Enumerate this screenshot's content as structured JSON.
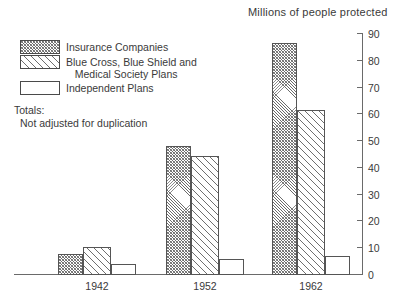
{
  "chart_data": {
    "type": "bar",
    "title": "Millions of people protected",
    "xlabel": "",
    "ylabel": "Millions of people protected",
    "categories": [
      "1942",
      "1952",
      "1962"
    ],
    "series": [
      {
        "name": "Insurance Companies",
        "values": [
          8,
          48,
          86.5
        ],
        "pattern": "dense-crosshatch"
      },
      {
        "name": "Blue Cross, Blue Shield and Medical Society Plans",
        "values": [
          10.5,
          44.5,
          61.5
        ],
        "pattern": "diagonal-hatch"
      },
      {
        "name": "Independent Plans",
        "values": [
          4,
          6,
          7
        ],
        "pattern": "empty"
      }
    ],
    "ylim": [
      0,
      90
    ],
    "yticks": [
      0,
      10,
      20,
      30,
      40,
      50,
      60,
      70,
      80,
      90
    ],
    "ytick_labels": [
      "0",
      "10",
      "20",
      "30",
      "40",
      "50",
      "60",
      "70",
      "80",
      "90"
    ],
    "grid": false,
    "legend_position": "upper-left",
    "axis_side": "right"
  },
  "legend": {
    "items": [
      {
        "label": "Insurance Companies",
        "pattern": "dense-crosshatch"
      },
      {
        "label": "Blue Cross, Blue Shield and\n   Medical Society Plans",
        "pattern": "diagonal-hatch"
      },
      {
        "label": "Independent Plans",
        "pattern": "empty"
      }
    ]
  },
  "notes": {
    "line1": "Totals:",
    "line2": "Not adjusted for duplication"
  }
}
